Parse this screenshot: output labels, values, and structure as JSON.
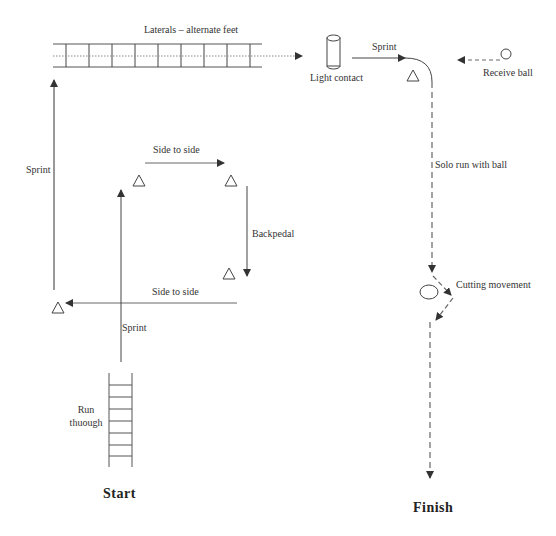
{
  "diagram": {
    "type": "soccer-agility-drill-course",
    "colors": {
      "line": "#444444",
      "dashed": "#666666",
      "dotted": "#888888",
      "background": "#ffffff"
    },
    "labels": {
      "laterals": "Laterals – alternate feet",
      "light_contact": "Light contact",
      "sprint_top": "Sprint",
      "receive_ball": "Receive ball",
      "sprint_left": "Sprint",
      "side_to_side_top": "Side to side",
      "backpedal": "Backpedal",
      "side_to_side_bottom": "Side to side",
      "sprint_center": "Sprint",
      "run_through": "Run thuough",
      "solo_run": "Solo run with ball",
      "cutting": "Cutting movement",
      "start": "Start",
      "finish": "Finish"
    },
    "nodes": [
      {
        "id": "cone-top-right-corner",
        "shape": "triangle",
        "x": 413,
        "y": 75
      },
      {
        "id": "cone-square-tl",
        "shape": "triangle",
        "x": 139,
        "y": 181
      },
      {
        "id": "cone-square-tr",
        "shape": "triangle",
        "x": 231,
        "y": 181
      },
      {
        "id": "cone-square-br",
        "shape": "triangle",
        "x": 229,
        "y": 275
      },
      {
        "id": "cone-left",
        "shape": "triangle",
        "x": 58,
        "y": 307
      },
      {
        "id": "dummy-cylinder",
        "shape": "cylinder",
        "x": 333,
        "y": 50
      },
      {
        "id": "ball",
        "shape": "circle",
        "x": 506,
        "y": 55
      },
      {
        "id": "obstacle",
        "shape": "ellipse",
        "x": 429,
        "y": 292
      },
      {
        "id": "ladder-horizontal",
        "shape": "ladder",
        "rungs": 9
      },
      {
        "id": "ladder-vertical",
        "shape": "ladder",
        "rungs": 7
      }
    ]
  }
}
